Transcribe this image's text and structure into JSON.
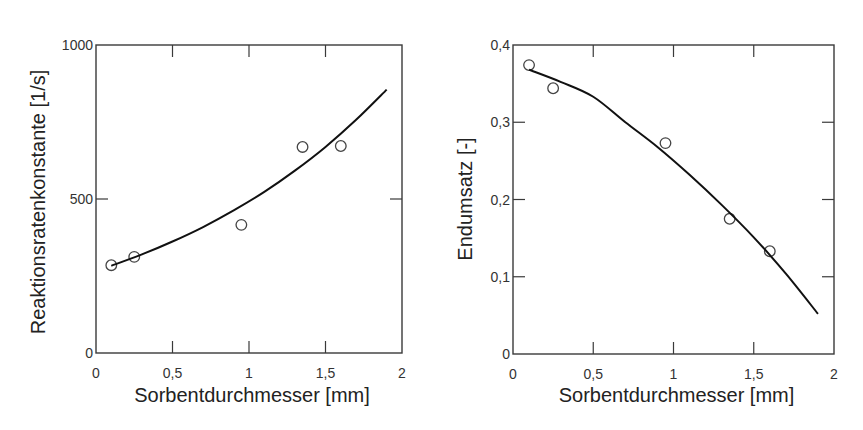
{
  "chart_data": [
    {
      "type": "scatter",
      "title": "",
      "xlabel": "Sorbentdurchmesser [mm]",
      "ylabel": "Reaktionsratenkonstante [1/s]",
      "xlim": [
        0,
        2
      ],
      "ylim": [
        0,
        1000
      ],
      "x_ticks": [
        "0",
        "0,5",
        "1",
        "1,5",
        "2"
      ],
      "y_ticks": [
        "0",
        "500",
        "1000"
      ],
      "grid": false,
      "legend": null,
      "series": [
        {
          "name": "Messwerte",
          "marker": "open-circle",
          "x": [
            0.1,
            0.25,
            0.95,
            1.35,
            1.6
          ],
          "y": [
            285,
            312,
            416,
            669,
            672
          ]
        },
        {
          "name": "Fit",
          "style": "line",
          "x": [
            0.1,
            0.3,
            0.5,
            0.7,
            0.9,
            1.1,
            1.3,
            1.5,
            1.7,
            1.9
          ],
          "y": [
            283,
            320,
            362,
            409,
            463,
            523,
            592,
            669,
            757,
            855
          ]
        }
      ]
    },
    {
      "type": "scatter",
      "title": "",
      "xlabel": "Sorbentdurchmesser [mm]",
      "ylabel": "Endumsatz [-]",
      "xlim": [
        0,
        2
      ],
      "ylim": [
        0,
        0.4
      ],
      "x_ticks": [
        "0",
        "0,5",
        "1",
        "1,5",
        "2"
      ],
      "y_ticks": [
        "0",
        "0,1",
        "0,2",
        "0,3",
        "0,4"
      ],
      "grid": false,
      "legend": null,
      "series": [
        {
          "name": "Messwerte",
          "marker": "open-circle",
          "x": [
            0.1,
            0.25,
            0.95,
            1.35,
            1.6
          ],
          "y": [
            0.374,
            0.344,
            0.273,
            0.175,
            0.133
          ]
        },
        {
          "name": "Fit",
          "style": "line",
          "x": [
            0.1,
            0.3,
            0.5,
            0.7,
            0.9,
            1.1,
            1.3,
            1.5,
            1.7,
            1.9
          ],
          "y": [
            0.368,
            0.352,
            0.333,
            0.3,
            0.268,
            0.232,
            0.193,
            0.151,
            0.104,
            0.052
          ]
        }
      ]
    }
  ],
  "left_chart": {
    "ylabel": "Reaktionsratenkonstante [1/s]",
    "xlabel": "Sorbentdurchmesser [mm]"
  },
  "right_chart": {
    "ylabel": "Endumsatz [-]",
    "xlabel": "Sorbentdurchmesser [mm]"
  }
}
